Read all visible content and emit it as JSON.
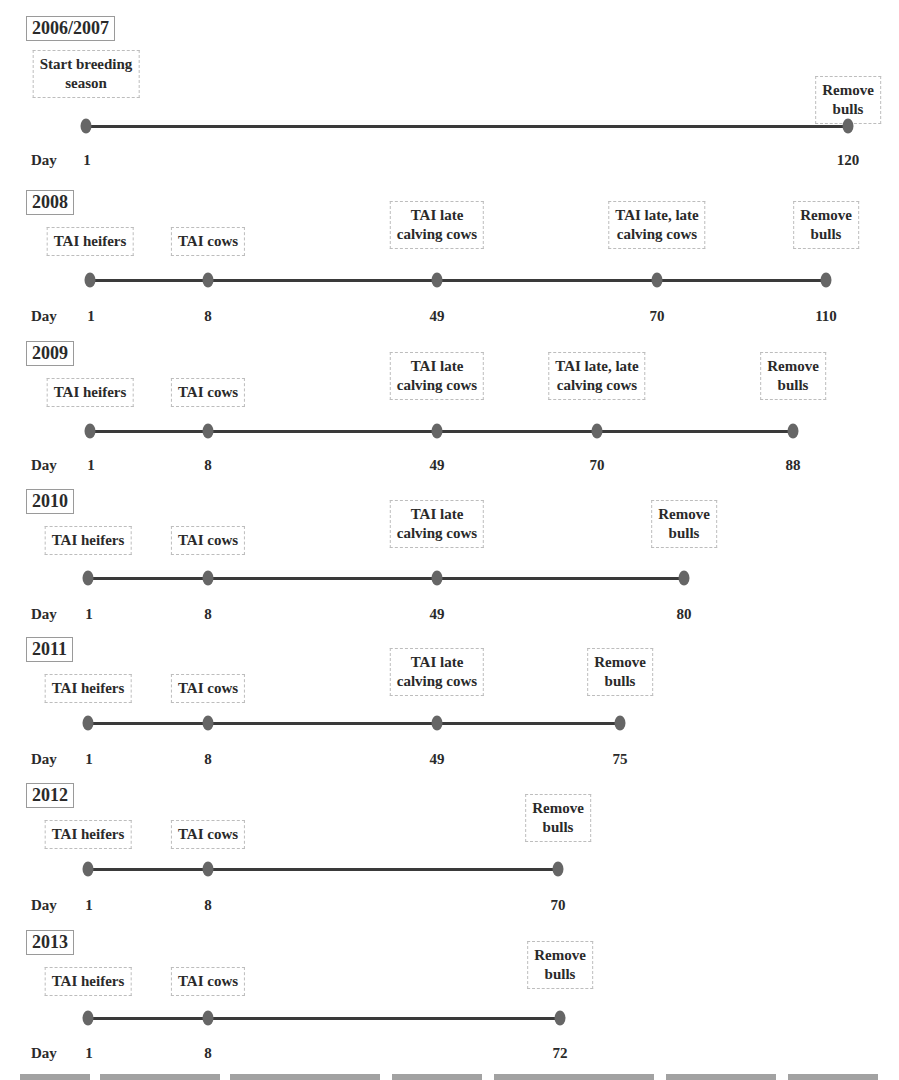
{
  "axis_label": "Day",
  "timelines": [
    {
      "year": "2006/2007",
      "events": [
        {
          "day": 1,
          "label": "Start breeding\nseason"
        },
        {
          "day": 120,
          "label": "Remove\nbulls"
        }
      ]
    },
    {
      "year": "2008",
      "events": [
        {
          "day": 1,
          "label": "TAI heifers"
        },
        {
          "day": 8,
          "label": "TAI cows"
        },
        {
          "day": 49,
          "label": "TAI late\ncalving cows"
        },
        {
          "day": 70,
          "label": "TAI late, late\ncalving cows"
        },
        {
          "day": 110,
          "label": "Remove\nbulls"
        }
      ]
    },
    {
      "year": "2009",
      "events": [
        {
          "day": 1,
          "label": "TAI heifers"
        },
        {
          "day": 8,
          "label": "TAI cows"
        },
        {
          "day": 49,
          "label": "TAI late\ncalving cows"
        },
        {
          "day": 70,
          "label": "TAI late, late\ncalving cows"
        },
        {
          "day": 88,
          "label": "Remove\nbulls"
        }
      ]
    },
    {
      "year": "2010",
      "events": [
        {
          "day": 1,
          "label": "TAI heifers"
        },
        {
          "day": 8,
          "label": "TAI cows"
        },
        {
          "day": 49,
          "label": "TAI late\ncalving cows"
        },
        {
          "day": 80,
          "label": "Remove\nbulls"
        }
      ]
    },
    {
      "year": "2011",
      "events": [
        {
          "day": 1,
          "label": "TAI heifers"
        },
        {
          "day": 8,
          "label": "TAI cows"
        },
        {
          "day": 49,
          "label": "TAI late\ncalving cows"
        },
        {
          "day": 75,
          "label": "Remove\nbulls"
        }
      ]
    },
    {
      "year": "2012",
      "events": [
        {
          "day": 1,
          "label": "TAI heifers"
        },
        {
          "day": 8,
          "label": "TAI cows"
        },
        {
          "day": 70,
          "label": "Remove\nbulls"
        }
      ]
    },
    {
      "year": "2013",
      "events": [
        {
          "day": 1,
          "label": "TAI heifers"
        },
        {
          "day": 8,
          "label": "TAI cows"
        },
        {
          "day": 72,
          "label": "Remove\nbulls"
        }
      ]
    }
  ]
}
